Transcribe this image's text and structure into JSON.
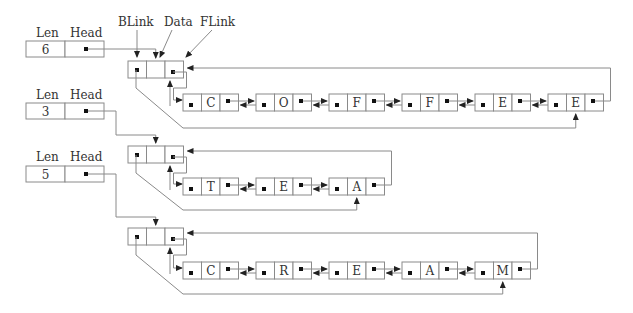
{
  "diagram": {
    "type": "doubly-linked circular lists with header nodes",
    "field_labels": {
      "blink": "BLink",
      "data": "Data",
      "flink": "FLink"
    },
    "colors": {
      "line": "#8a8a8a",
      "pointer": "#111111",
      "text": "#333333",
      "background": "#ffffff"
    },
    "lists": [
      {
        "len_label": "Len",
        "head_label": "Head",
        "len_value": "6",
        "nodes": [
          "C",
          "O",
          "F",
          "F",
          "E",
          "E"
        ]
      },
      {
        "len_label": "Len",
        "head_label": "Head",
        "len_value": "3",
        "nodes": [
          "T",
          "E",
          "A"
        ]
      },
      {
        "len_label": "Len",
        "head_label": "Head",
        "len_value": "5",
        "nodes": [
          "C",
          "R",
          "E",
          "A",
          "M"
        ]
      }
    ]
  }
}
